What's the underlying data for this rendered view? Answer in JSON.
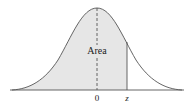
{
  "diagram": {
    "type": "normal-distribution-curve",
    "shaded_region_label": "Area",
    "axis_labels": {
      "center": "0",
      "right": "z"
    },
    "colors": {
      "curve": "#555555",
      "fill": "#e6e6e6",
      "axis": "#555555",
      "text": "#222222"
    }
  }
}
